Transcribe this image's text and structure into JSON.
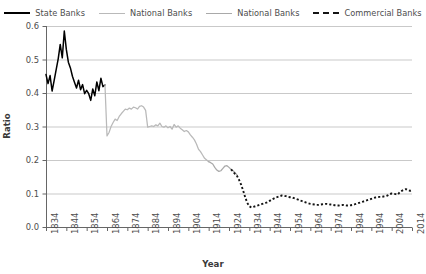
{
  "chart_data": {
    "type": "line",
    "title": "",
    "xlabel": "Year",
    "ylabel": "Ratio",
    "xlim": [
      1834,
      2014
    ],
    "ylim": [
      0.0,
      0.6
    ],
    "grid": true,
    "legend_position": "top",
    "xticks": [
      1834,
      1844,
      1854,
      1864,
      1874,
      1884,
      1894,
      1904,
      1914,
      1924,
      1934,
      1944,
      1954,
      1964,
      1974,
      1984,
      1994,
      2004,
      2014
    ],
    "yticks": [
      "0.0",
      "0.1",
      "0.2",
      "0.3",
      "0.4",
      "0.5",
      "0.6"
    ],
    "colors": {
      "state_banks": "#000000",
      "national_banks_a": "#b9b9b9",
      "national_banks_b": "#a9a9a9",
      "commercial_banks": "#141414",
      "gridline": "#c9c9c9",
      "axis": "#666666"
    },
    "series": [
      {
        "name": "State Banks",
        "style": "solid",
        "color": "#000000",
        "x": [
          1834,
          1835,
          1836,
          1837,
          1838,
          1839,
          1840,
          1841,
          1842,
          1843,
          1844,
          1845,
          1846,
          1847,
          1848,
          1849,
          1850,
          1851,
          1852,
          1853,
          1854,
          1855,
          1856,
          1857,
          1858,
          1859,
          1860,
          1861,
          1862,
          1863
        ],
        "values": [
          0.455,
          0.428,
          0.452,
          0.406,
          0.437,
          0.47,
          0.502,
          0.545,
          0.505,
          0.585,
          0.53,
          0.492,
          0.475,
          0.45,
          0.432,
          0.415,
          0.438,
          0.41,
          0.425,
          0.398,
          0.408,
          0.398,
          0.378,
          0.412,
          0.392,
          0.433,
          0.407,
          0.444,
          0.419,
          0.424
        ]
      },
      {
        "name": "National Banks",
        "style": "solid",
        "color": "#b9b9b9",
        "x": [
          1863,
          1864,
          1865,
          1866,
          1867,
          1868,
          1869,
          1870,
          1871,
          1872,
          1873,
          1874,
          1875,
          1876,
          1877,
          1878,
          1879,
          1880,
          1881,
          1882,
          1883,
          1884,
          1885,
          1886,
          1887,
          1888,
          1889,
          1890,
          1891,
          1892,
          1893,
          1894,
          1895,
          1896,
          1897,
          1898,
          1899,
          1900,
          1901,
          1902,
          1903,
          1904,
          1905,
          1906,
          1907,
          1908,
          1909,
          1910,
          1911,
          1912,
          1913,
          1914
        ],
        "values": [
          0.424,
          0.272,
          0.282,
          0.3,
          0.312,
          0.322,
          0.318,
          0.33,
          0.338,
          0.345,
          0.352,
          0.35,
          0.355,
          0.352,
          0.358,
          0.356,
          0.352,
          0.36,
          0.362,
          0.358,
          0.348,
          0.298,
          0.3,
          0.302,
          0.3,
          0.305,
          0.302,
          0.31,
          0.3,
          0.298,
          0.302,
          0.296,
          0.3,
          0.292,
          0.306,
          0.298,
          0.302,
          0.295,
          0.29,
          0.285,
          0.288,
          0.284,
          0.275,
          0.268,
          0.26,
          0.248,
          0.232,
          0.225,
          0.215,
          0.205,
          0.2,
          0.195
        ]
      },
      {
        "name": "National Banks",
        "style": "solid",
        "color": "#a9a9a9",
        "x": [
          1914,
          1915,
          1916,
          1917,
          1918,
          1919,
          1920,
          1921,
          1922,
          1923,
          1924,
          1925,
          1926,
          1927,
          1928
        ],
        "values": [
          0.195,
          0.192,
          0.188,
          0.178,
          0.17,
          0.166,
          0.168,
          0.175,
          0.182,
          0.183,
          0.178,
          0.172,
          0.168,
          0.162,
          0.155
        ]
      },
      {
        "name": "Commercial Banks",
        "style": "dotted",
        "color": "#141414",
        "x": [
          1925,
          1926,
          1927,
          1928,
          1929,
          1930,
          1931,
          1932,
          1933,
          1934,
          1935,
          1936,
          1937,
          1938,
          1939,
          1940,
          1941,
          1942,
          1943,
          1944,
          1945,
          1946,
          1947,
          1948,
          1949,
          1950,
          1951,
          1952,
          1953,
          1954,
          1955,
          1956,
          1957,
          1958,
          1959,
          1960,
          1961,
          1962,
          1963,
          1964,
          1965,
          1966,
          1967,
          1968,
          1969,
          1970,
          1971,
          1972,
          1973,
          1974,
          1975,
          1976,
          1977,
          1978,
          1979,
          1980,
          1981,
          1982,
          1983,
          1984,
          1985,
          1986,
          1987,
          1988,
          1989,
          1990,
          1991,
          1992,
          1993,
          1994,
          1995,
          1996,
          1997,
          1998,
          1999,
          2000,
          2001,
          2002,
          2003,
          2004,
          2005,
          2006,
          2007,
          2008,
          2009,
          2010,
          2011,
          2012,
          2013,
          2014
        ],
        "values": [
          0.172,
          0.166,
          0.158,
          0.152,
          0.14,
          0.126,
          0.108,
          0.088,
          0.072,
          0.062,
          0.058,
          0.06,
          0.062,
          0.064,
          0.066,
          0.068,
          0.07,
          0.072,
          0.074,
          0.078,
          0.082,
          0.085,
          0.088,
          0.09,
          0.092,
          0.094,
          0.093,
          0.092,
          0.09,
          0.089,
          0.088,
          0.086,
          0.084,
          0.082,
          0.079,
          0.077,
          0.075,
          0.073,
          0.071,
          0.069,
          0.068,
          0.067,
          0.066,
          0.066,
          0.067,
          0.068,
          0.069,
          0.069,
          0.068,
          0.067,
          0.066,
          0.065,
          0.064,
          0.064,
          0.065,
          0.066,
          0.065,
          0.064,
          0.064,
          0.065,
          0.066,
          0.068,
          0.07,
          0.072,
          0.074,
          0.076,
          0.078,
          0.08,
          0.082,
          0.084,
          0.086,
          0.088,
          0.089,
          0.09,
          0.09,
          0.091,
          0.092,
          0.094,
          0.098,
          0.1,
          0.099,
          0.098,
          0.097,
          0.104,
          0.108,
          0.111,
          0.113,
          0.11,
          0.108,
          0.11
        ]
      }
    ]
  },
  "legend": {
    "items": [
      {
        "label": "State Banks",
        "swatch": "sw-solid-dark"
      },
      {
        "label": "National Banks",
        "swatch": "sw-solid-gray1"
      },
      {
        "label": "National Banks",
        "swatch": "sw-solid-gray2"
      },
      {
        "label": "Commercial Banks",
        "swatch": "sw-dotted"
      }
    ]
  },
  "axes": {
    "x_title": "Year",
    "y_title": "Ratio"
  }
}
